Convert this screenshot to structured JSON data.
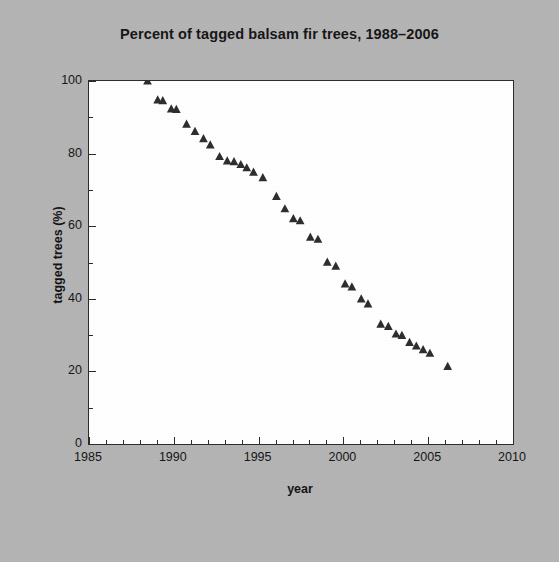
{
  "figure": {
    "background_color": "#b4b4b4",
    "plot_background_color": "#ffffff",
    "axis_color": "#2b2b2b",
    "marker_color": "#2d2d2d"
  },
  "chart_data": {
    "type": "scatter",
    "title": "Percent of tagged balsam fir trees, 1988–2006",
    "xlabel": "year",
    "ylabel": "tagged trees (%)",
    "xlim": [
      1985,
      2010
    ],
    "ylim": [
      0,
      100
    ],
    "grid": false,
    "legend": null,
    "marker": "triangle",
    "xticks": [
      1985,
      1990,
      1995,
      2000,
      2005,
      2010
    ],
    "xtick_labels": [
      "1985",
      "1990",
      "1995",
      "2000",
      "2005",
      "2010"
    ],
    "x_minor_tick_step": 1,
    "yticks": [
      0,
      20,
      40,
      60,
      80,
      100
    ],
    "ytick_labels": [
      "0",
      "20",
      "40",
      "60",
      "80",
      "100"
    ],
    "y_minor_tick_step": 10,
    "series": [
      {
        "name": "tagged trees",
        "points": [
          [
            1988.45,
            100.0
          ],
          [
            1989.05,
            94.8
          ],
          [
            1989.35,
            94.6
          ],
          [
            1989.85,
            92.3
          ],
          [
            1990.15,
            92.2
          ],
          [
            1990.75,
            88.1
          ],
          [
            1991.25,
            86.1
          ],
          [
            1991.75,
            84.1
          ],
          [
            1992.15,
            82.4
          ],
          [
            1992.7,
            79.2
          ],
          [
            1993.15,
            78.0
          ],
          [
            1993.55,
            77.8
          ],
          [
            1993.95,
            77.0
          ],
          [
            1994.3,
            76.1
          ],
          [
            1994.7,
            74.9
          ],
          [
            1995.25,
            73.4
          ],
          [
            1996.05,
            68.2
          ],
          [
            1996.55,
            64.8
          ],
          [
            1997.05,
            62.1
          ],
          [
            1997.45,
            61.5
          ],
          [
            1998.05,
            57.0
          ],
          [
            1998.5,
            56.4
          ],
          [
            1999.05,
            50.1
          ],
          [
            1999.55,
            49.0
          ],
          [
            2000.1,
            44.1
          ],
          [
            2000.5,
            43.3
          ],
          [
            2001.05,
            40.0
          ],
          [
            2001.45,
            38.6
          ],
          [
            2002.2,
            33.0
          ],
          [
            2002.65,
            32.4
          ],
          [
            2003.1,
            30.3
          ],
          [
            2003.45,
            29.9
          ],
          [
            2003.9,
            28.0
          ],
          [
            2004.3,
            27.0
          ],
          [
            2004.7,
            26.0
          ],
          [
            2005.1,
            25.0
          ],
          [
            2006.15,
            21.4
          ]
        ]
      }
    ]
  }
}
